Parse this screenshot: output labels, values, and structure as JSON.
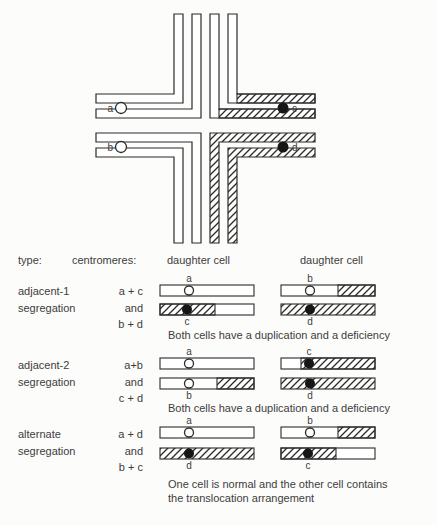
{
  "cross": {
    "labels": {
      "a": "a",
      "b": "b",
      "c": "c",
      "d": "d"
    }
  },
  "table": {
    "col_headers": {
      "type": "type:",
      "centromeres": "centromeres:",
      "daughter1": "daughter cell",
      "daughter2": "daughter cell"
    },
    "rows": [
      {
        "type": [
          "adjacent-1",
          "segregation"
        ],
        "centromeres": [
          "a + c",
          "and",
          "b + d"
        ],
        "cells": [
          {
            "bars": [
              {
                "label": "a",
                "pattern": "all-white"
              },
              {
                "label": "c",
                "pattern": "hatched-left-white-right"
              }
            ]
          },
          {
            "bars": [
              {
                "label": "b",
                "pattern": "white-with-hatched-tip"
              },
              {
                "label": "d",
                "pattern": "all-hatched"
              }
            ]
          }
        ],
        "caption": [
          "Both cells have a duplication and a deficiency"
        ]
      },
      {
        "type": [
          "adjacent-2",
          "segregation"
        ],
        "centromeres": [
          "a+b",
          "and",
          "c + d"
        ],
        "cells": [
          {
            "bars": [
              {
                "label": "a",
                "pattern": "all-white"
              },
              {
                "label": "b",
                "pattern": "white-with-hatched-tip"
              }
            ]
          },
          {
            "bars": [
              {
                "label": "c",
                "pattern": "white-tip-left-hatched-right"
              },
              {
                "label": "d",
                "pattern": "all-hatched"
              }
            ]
          }
        ],
        "caption": [
          "Both cells have a duplication and a deficiency"
        ]
      },
      {
        "type": [
          "alternate",
          "segregation"
        ],
        "centromeres": [
          "a + d",
          "and",
          "b + c"
        ],
        "cells": [
          {
            "bars": [
              {
                "label": "a",
                "pattern": "all-white"
              },
              {
                "label": "d",
                "pattern": "all-hatched"
              }
            ]
          },
          {
            "bars": [
              {
                "label": "b",
                "pattern": "white-with-hatched-tip"
              },
              {
                "label": "c",
                "pattern": "hatched-left-white-right"
              }
            ]
          }
        ],
        "caption": [
          "One cell is normal and the other cell contains",
          "the translocation arrangement"
        ]
      }
    ]
  },
  "colors": {
    "ink": "#2b2b2b",
    "text": "#3c3c3c",
    "background": "#fcfcfb"
  }
}
